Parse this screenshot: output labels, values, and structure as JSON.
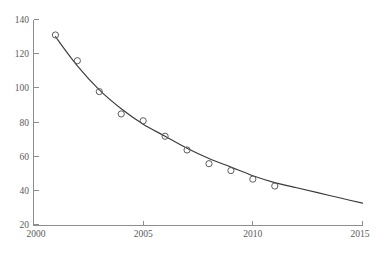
{
  "chart_data": {
    "type": "scatter",
    "title": "",
    "subtitle": "",
    "xlabel": "",
    "ylabel": "",
    "xlim": [
      2000,
      2015
    ],
    "ylim": [
      20,
      140
    ],
    "xticks": [
      2000,
      2005,
      2010,
      2015
    ],
    "xtick_labels": [
      "2000",
      "2005",
      "2010",
      "2015"
    ],
    "yticks": [
      20,
      40,
      60,
      80,
      100,
      120,
      140
    ],
    "ytick_labels": [
      "20",
      "40",
      "60",
      "80",
      "100",
      "120",
      "140"
    ],
    "grid": false,
    "legend": null,
    "legend_position": "none",
    "marker_style": "open-circle",
    "series": [
      {
        "name": "observed",
        "type": "scatter",
        "x": [
          2001,
          2002,
          2003,
          2004,
          2005,
          2006,
          2007,
          2008,
          2009,
          2010,
          2011
        ],
        "values": [
          131,
          116,
          98,
          85,
          81,
          72,
          64,
          56,
          52,
          47,
          43
        ]
      },
      {
        "name": "fitted-curve",
        "type": "line",
        "x": [
          2001,
          2002,
          2003,
          2004,
          2005,
          2006,
          2007,
          2008,
          2009,
          2010,
          2011,
          2012,
          2013,
          2014,
          2015
        ],
        "values": [
          130,
          113,
          99,
          88,
          79,
          72,
          65,
          59,
          54,
          49,
          45,
          42,
          39,
          36,
          33
        ]
      }
    ],
    "annotations": []
  },
  "caption": {
    "text": ""
  },
  "colors": {
    "axis": "#8d8d8d",
    "curve": "#3a3a3a",
    "marker": "#5d5d5d",
    "tick_text": "#5a5a5a",
    "background": "#ffffff"
  }
}
